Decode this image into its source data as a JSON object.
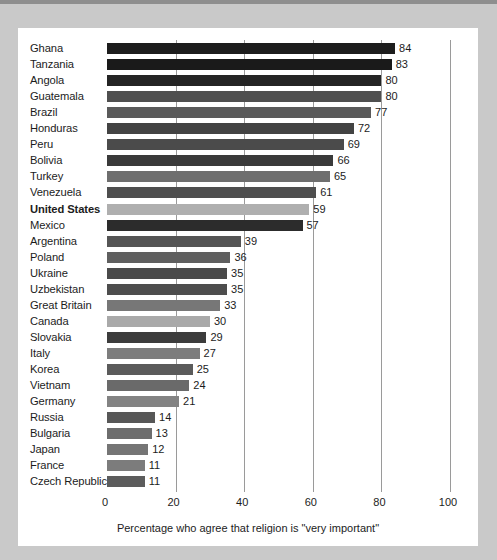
{
  "chart_data": {
    "type": "bar",
    "orientation": "horizontal",
    "title": "",
    "xlabel": "Percentage who agree that religion is \"very important\"",
    "ylabel": "",
    "xlim": [
      0,
      100
    ],
    "xticks": [
      0,
      20,
      40,
      60,
      80,
      100
    ],
    "xtick_labels": [
      "0",
      "20",
      "40",
      "60",
      "80",
      "100"
    ],
    "grid": true,
    "grid_axis": "x",
    "legend": false,
    "categories": [
      "Ghana",
      "Tanzania",
      "Angola",
      "Guatemala",
      "Brazil",
      "Honduras",
      "Peru",
      "Bolivia",
      "Turkey",
      "Venezuela",
      "United States",
      "Mexico",
      "Argentina",
      "Poland",
      "Ukraine",
      "Uzbekistan",
      "Great Britain",
      "Canada",
      "Slovakia",
      "Italy",
      "Korea",
      "Vietnam",
      "Germany",
      "Russia",
      "Bulgaria",
      "Japan",
      "France",
      "Czech Republic"
    ],
    "values": [
      84,
      83,
      80,
      80,
      77,
      72,
      69,
      66,
      65,
      61,
      59,
      57,
      39,
      36,
      35,
      35,
      33,
      30,
      29,
      27,
      25,
      24,
      21,
      14,
      13,
      12,
      11,
      11
    ],
    "bar_colors": [
      "#1d1d1d",
      "#1a1a1a",
      "#242424",
      "#4f4f4f",
      "#5a5a5a",
      "#434343",
      "#4b4b4b",
      "#3a3a3a",
      "#6e6e6e",
      "#4e4e4e",
      "#afafaf",
      "#2c2c2c",
      "#555555",
      "#5f5f5f",
      "#4a4a4a",
      "#4d4d4d",
      "#777777",
      "#a9a9a9",
      "#3c3c3c",
      "#7d7d7d",
      "#5b5b5b",
      "#6a6a6a",
      "#838383",
      "#575757",
      "#6d6d6d",
      "#757575",
      "#7c7c7c",
      "#5c5c5c"
    ],
    "highlighted_category": "United States"
  },
  "caption": "Percentage who agree that religion is \"very important\"",
  "colors": {
    "panel_background": "#ffffff",
    "page_background": "#c9c9c9",
    "top_strip": "#8e8e8e",
    "gridline": "#9a9a9a",
    "text": "#1c1c1c",
    "highlight_bar": "#afafaf"
  }
}
